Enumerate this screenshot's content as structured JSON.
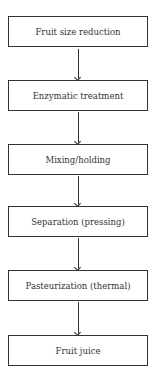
{
  "flowchart": {
    "steps": [
      {
        "label": "Fruit size reduction"
      },
      {
        "label": "Enzymatic treatment"
      },
      {
        "label": "Mixing/holding"
      },
      {
        "label": "Separation (pressing)"
      },
      {
        "label": "Pasteurization (thermal)"
      },
      {
        "label": "Fruit juice"
      }
    ],
    "connectors": [
      {
        "from": 0,
        "to": 1
      },
      {
        "from": 1,
        "to": 2
      },
      {
        "from": 2,
        "to": 3
      },
      {
        "from": 3,
        "to": 4
      },
      {
        "from": 4,
        "to": 5
      }
    ]
  }
}
